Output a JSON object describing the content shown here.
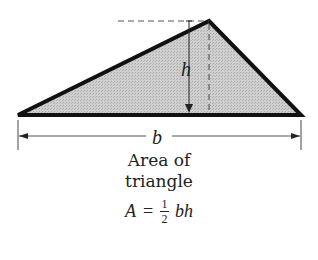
{
  "diagram": {
    "labels": {
      "height": "h",
      "base": "b"
    },
    "caption_lines": [
      "Area of",
      "triangle"
    ],
    "formula": {
      "lhs": "A",
      "equals": "=",
      "numerator": "1",
      "denominator": "2",
      "rhs": "bh"
    },
    "colors": {
      "fill": "#c8c8c8",
      "stroke": "#111111",
      "guide": "#555555"
    }
  }
}
